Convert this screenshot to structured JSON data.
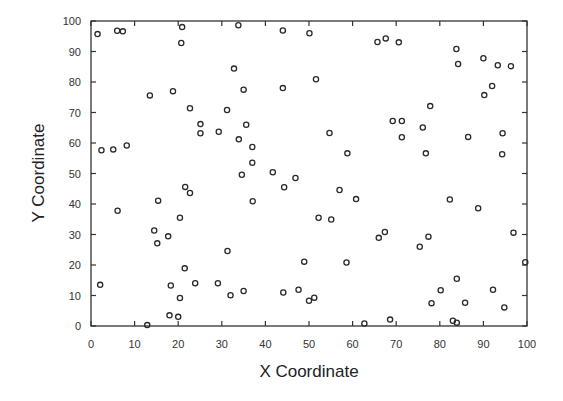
{
  "chart_data": {
    "type": "scatter",
    "title": "",
    "xlabel": "X Coordinate",
    "ylabel": "Y Coordinate",
    "xlim": [
      0,
      100
    ],
    "ylim": [
      0,
      100
    ],
    "xticks": [
      0,
      10,
      20,
      30,
      40,
      50,
      60,
      70,
      80,
      90,
      100
    ],
    "yticks": [
      0,
      10,
      20,
      30,
      40,
      50,
      60,
      70,
      80,
      90,
      100
    ],
    "grid": false,
    "legend": null,
    "marker": "open-circle",
    "series": [
      {
        "name": "points",
        "points": [
          [
            1.5,
            95.7
          ],
          [
            6.0,
            96.8
          ],
          [
            7.3,
            96.6
          ],
          [
            20.9,
            98.0
          ],
          [
            20.7,
            92.8
          ],
          [
            13.5,
            75.6
          ],
          [
            18.8,
            77.0
          ],
          [
            22.7,
            71.4
          ],
          [
            33.8,
            98.6
          ],
          [
            44.0,
            96.9
          ],
          [
            32.8,
            84.4
          ],
          [
            35.0,
            77.5
          ],
          [
            44.0,
            78.0
          ],
          [
            31.2,
            70.8
          ],
          [
            25.1,
            66.2
          ],
          [
            35.6,
            66.0
          ],
          [
            50.1,
            96.0
          ],
          [
            65.7,
            93.1
          ],
          [
            67.6,
            94.3
          ],
          [
            70.6,
            93.0
          ],
          [
            51.6,
            80.9
          ],
          [
            69.2,
            67.2
          ],
          [
            71.3,
            67.2
          ],
          [
            83.8,
            90.8
          ],
          [
            84.2,
            85.9
          ],
          [
            90.0,
            87.8
          ],
          [
            93.3,
            85.5
          ],
          [
            96.3,
            85.2
          ],
          [
            92.0,
            78.7
          ],
          [
            90.2,
            75.7
          ],
          [
            77.8,
            72.1
          ],
          [
            76.1,
            65.1
          ],
          [
            86.5,
            62.0
          ],
          [
            94.4,
            63.2
          ],
          [
            2.4,
            57.6
          ],
          [
            5.1,
            57.9
          ],
          [
            8.2,
            59.2
          ],
          [
            21.6,
            45.6
          ],
          [
            22.7,
            43.6
          ],
          [
            15.4,
            41.1
          ],
          [
            6.1,
            37.8
          ],
          [
            20.4,
            35.5
          ],
          [
            25.1,
            63.2
          ],
          [
            29.3,
            63.7
          ],
          [
            33.9,
            61.2
          ],
          [
            37.0,
            58.7
          ],
          [
            37.0,
            53.5
          ],
          [
            34.6,
            49.6
          ],
          [
            41.7,
            50.4
          ],
          [
            46.9,
            48.5
          ],
          [
            44.3,
            45.5
          ],
          [
            37.1,
            40.9
          ],
          [
            54.7,
            63.3
          ],
          [
            71.3,
            61.9
          ],
          [
            58.8,
            56.6
          ],
          [
            57.0,
            44.6
          ],
          [
            60.8,
            41.6
          ],
          [
            52.2,
            35.5
          ],
          [
            55.1,
            34.9
          ],
          [
            76.8,
            56.6
          ],
          [
            94.3,
            56.3
          ],
          [
            82.3,
            41.5
          ],
          [
            88.8,
            38.6
          ],
          [
            96.9,
            30.6
          ],
          [
            77.4,
            29.3
          ],
          [
            75.4,
            26.0
          ],
          [
            14.5,
            31.3
          ],
          [
            17.7,
            29.4
          ],
          [
            15.2,
            27.1
          ],
          [
            21.5,
            18.9
          ],
          [
            2.1,
            13.5
          ],
          [
            18.3,
            13.3
          ],
          [
            23.9,
            14.0
          ],
          [
            20.4,
            9.2
          ],
          [
            18.0,
            3.5
          ],
          [
            20.0,
            3.0
          ],
          [
            12.9,
            0.3
          ],
          [
            31.3,
            24.6
          ],
          [
            29.1,
            14.0
          ],
          [
            32.0,
            10.1
          ],
          [
            35.0,
            11.5
          ],
          [
            44.1,
            11.0
          ],
          [
            47.6,
            11.9
          ],
          [
            48.9,
            21.1
          ],
          [
            50.0,
            8.3
          ],
          [
            51.2,
            9.3
          ],
          [
            66.0,
            28.9
          ],
          [
            67.4,
            30.8
          ],
          [
            58.6,
            20.8
          ],
          [
            62.7,
            0.8
          ],
          [
            68.6,
            2.1
          ],
          [
            99.6,
            20.9
          ],
          [
            83.9,
            15.5
          ],
          [
            80.2,
            11.7
          ],
          [
            92.2,
            11.9
          ],
          [
            78.1,
            7.5
          ],
          [
            85.8,
            7.6
          ],
          [
            94.8,
            6.1
          ],
          [
            83.0,
            1.7
          ],
          [
            83.9,
            1.1
          ]
        ]
      }
    ]
  },
  "layout": {
    "plot_left": 91,
    "plot_right": 527,
    "plot_top": 21,
    "plot_bottom": 326
  },
  "colors": {
    "marker": "#2a2a2a",
    "axis": "#333333",
    "background": "#ffffff"
  }
}
